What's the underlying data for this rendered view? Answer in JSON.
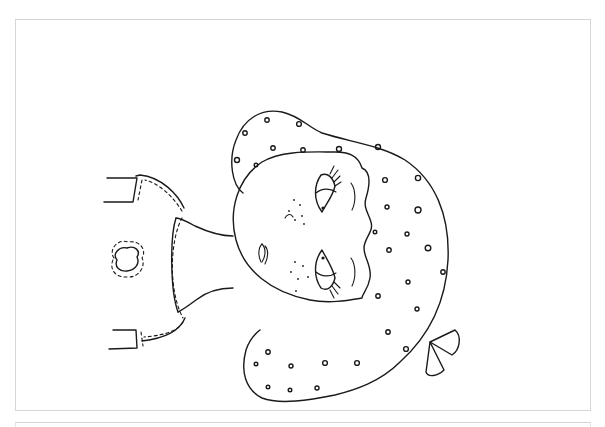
{
  "page": {
    "orientation": "rotated 90 degrees counter-clockwise",
    "line_color": "#1a1a1a",
    "background_color": "#ffffff",
    "frame_color": "#d6d6d6"
  },
  "drawing": {
    "subject": "girl with polka-dot hair and bow",
    "parts": [
      "hair",
      "face",
      "eyes",
      "eyelashes",
      "eyebrows",
      "freckles",
      "nose",
      "mouth",
      "neck",
      "shirt",
      "heart-patch",
      "bow",
      "sleeves"
    ]
  }
}
